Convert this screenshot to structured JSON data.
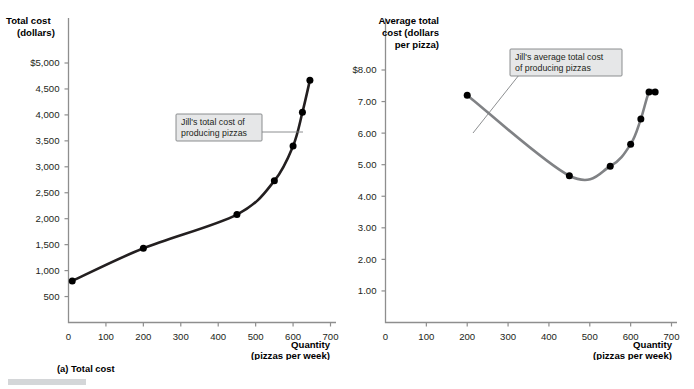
{
  "figure": {
    "header_ghost": "",
    "panels": [
      {
        "id": "a",
        "caption": "(a) Total cost",
        "y_title_lines": [
          "Total cost",
          "(dollars)"
        ],
        "x_title_lines": [
          "Quantity",
          "(pizzas per week)"
        ]
      },
      {
        "id": "b",
        "caption": "(b) Average total cost",
        "y_title_lines": [
          "Average total",
          "cost (dollars",
          "per pizza)"
        ],
        "x_title_lines": [
          "Quantity",
          "(pizzas per week)"
        ]
      }
    ]
  },
  "callouts": {
    "total_cost": {
      "lines": [
        "Jill's total cost of",
        "producing pizzas"
      ]
    },
    "average_total_cost": {
      "lines": [
        "Jill's average total cost",
        "of producing pizzas"
      ]
    }
  },
  "chart_data": [
    {
      "type": "line",
      "id": "total-cost",
      "title": "(a) Total cost",
      "xlabel": "Quantity (pizzas per week)",
      "ylabel": "Total cost (dollars)",
      "xlim": [
        0,
        700
      ],
      "ylim": [
        0,
        5250
      ],
      "grid": false,
      "legend": "none",
      "xticks": [
        0,
        100,
        200,
        300,
        400,
        500,
        600,
        700
      ],
      "xticklabels": [
        "0",
        "100",
        "200",
        "300",
        "400",
        "500",
        "600",
        "700"
      ],
      "yticks": [
        500,
        1000,
        1500,
        2000,
        2500,
        3000,
        3500,
        4000,
        4500,
        5000
      ],
      "yticklabels": [
        "500",
        "1,000",
        "1,500",
        "2,000",
        "2,500",
        "3,000",
        "3,500",
        "4,000",
        "4,500",
        "$5,000"
      ],
      "series": [
        {
          "name": "Jill's total cost of producing pizzas",
          "color": "#231f20",
          "x": [
            10,
            200,
            450,
            550,
            600,
            625,
            645
          ],
          "y": [
            800,
            1430,
            2080,
            2730,
            3400,
            4050,
            4670
          ]
        }
      ],
      "annotations": [
        {
          "text": "Jill's total cost of producing pizzas",
          "points_to_x": 612,
          "points_to_y": 3700
        }
      ]
    },
    {
      "type": "line",
      "id": "average-total-cost",
      "title": "(b) Average total cost",
      "xlabel": "Quantity (pizzas per week)",
      "ylabel": "Average total cost (dollars per pizza)",
      "xlim": [
        0,
        700
      ],
      "ylim": [
        0,
        8.4
      ],
      "grid": false,
      "legend": "none",
      "xticks": [
        0,
        100,
        200,
        300,
        400,
        500,
        600,
        700
      ],
      "xticklabels": [
        "0",
        "100",
        "200",
        "300",
        "400",
        "500",
        "600",
        "700"
      ],
      "yticks": [
        1.0,
        2.0,
        3.0,
        4.0,
        5.0,
        6.0,
        7.0,
        8.0
      ],
      "yticklabels": [
        "1.00",
        "2.00",
        "3.00",
        "4.00",
        "5.00",
        "6.00",
        "7.00",
        "$8.00"
      ],
      "series": [
        {
          "name": "Jill's average total cost of producing pizzas",
          "color": "#808285",
          "x": [
            200,
            450,
            550,
            600,
            625,
            645,
            660
          ],
          "y": [
            7.2,
            4.65,
            4.95,
            5.65,
            6.45,
            7.3,
            7.3
          ]
        }
      ],
      "annotations": [
        {
          "text": "Jill's average total cost of producing pizzas",
          "points_to_x": 398,
          "points_to_y": 5.6
        }
      ]
    }
  ]
}
